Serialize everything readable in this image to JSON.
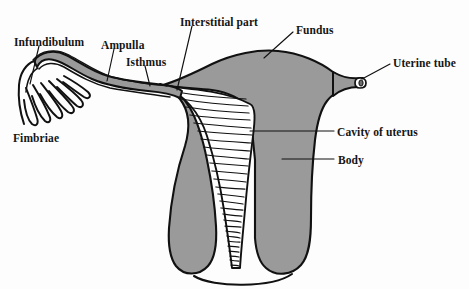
{
  "figure": {
    "kind": "anatomical-diagram",
    "background_color": "#fdfdfd",
    "myometrium_fill": "#9a9a9a",
    "cavity_fill": "#ffffff",
    "outline_color": "#111111"
  },
  "labels": {
    "infundibulum": "Infundibulum",
    "fimbriae": "Fimbriae",
    "ampulla": "Ampulla",
    "isthmus": "Isthmus",
    "interstitial_part": "Interstitial part",
    "fundus": "Fundus",
    "uterine_tube": "Uterine tube",
    "cavity_of_uterus": "Cavity of uterus",
    "body": "Body"
  },
  "label_positions": {
    "infundibulum": {
      "x": 14,
      "y": 37
    },
    "fimbriae": {
      "x": 13,
      "y": 133
    },
    "ampulla": {
      "x": 101,
      "y": 40
    },
    "isthmus": {
      "x": 126,
      "y": 57
    },
    "interstitial_part": {
      "x": 180,
      "y": 17
    },
    "fundus": {
      "x": 296,
      "y": 25
    },
    "uterine_tube": {
      "x": 393,
      "y": 58
    },
    "cavity_of_uterus": {
      "x": 337,
      "y": 127
    },
    "body": {
      "x": 338,
      "y": 155
    }
  },
  "leader_lines": [
    {
      "name": "infundibulum-leader",
      "x1": 39,
      "y1": 46,
      "x2": 30,
      "y2": 84
    },
    {
      "name": "ampulla-leader",
      "x1": 114,
      "y1": 49,
      "x2": 107,
      "y2": 81
    },
    {
      "name": "isthmus-leader",
      "x1": 145,
      "y1": 66,
      "x2": 150,
      "y2": 86
    },
    {
      "name": "interstitial-leader",
      "x1": 192,
      "y1": 26,
      "x2": 177,
      "y2": 90
    },
    {
      "name": "fundus-leader",
      "x1": 293,
      "y1": 32,
      "x2": 264,
      "y2": 58
    },
    {
      "name": "uterine-tube-leader",
      "x1": 390,
      "y1": 64,
      "x2": 362,
      "y2": 79
    },
    {
      "name": "cavity-leader",
      "x1": 334,
      "y1": 131,
      "x2": 250,
      "y2": 131
    },
    {
      "name": "body-leader",
      "x1": 334,
      "y1": 159,
      "x2": 282,
      "y2": 159
    }
  ],
  "parts": [
    {
      "id": "infundibulum",
      "description": "funnel-shaped lateral end of the uterine tube"
    },
    {
      "id": "fimbriae",
      "description": "finger-like projections at the infundibulum",
      "count": 6
    },
    {
      "id": "ampulla",
      "description": "widest, longest section of the uterine tube"
    },
    {
      "id": "isthmus",
      "description": "narrow medial section of the uterine tube"
    },
    {
      "id": "interstitial-part",
      "description": "intramural segment passing through the uterine wall"
    },
    {
      "id": "fundus",
      "description": "rounded superior dome of the uterus"
    },
    {
      "id": "uterine-tube",
      "description": "cut right uterine tube shown in cross-section"
    },
    {
      "id": "cavity-of-uterus",
      "description": "triangular endometrial cavity with transverse folds"
    },
    {
      "id": "body",
      "description": "main muscular portion of the uterus"
    }
  ]
}
